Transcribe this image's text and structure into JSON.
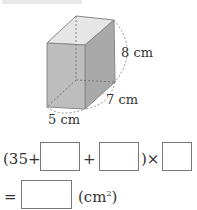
{
  "figure": {
    "shape": "rectangular-prism",
    "labels": {
      "height": "8 cm",
      "depth": "7 cm",
      "width": "5 cm"
    }
  },
  "equation": {
    "line1": {
      "open": "(35+",
      "plus": "+",
      "close_times": ")×"
    },
    "line2": {
      "equals": "=",
      "unit": "(cm",
      "unit_sup": "2",
      "unit_close": ")"
    },
    "blanks": [
      "",
      "",
      "",
      ""
    ]
  }
}
